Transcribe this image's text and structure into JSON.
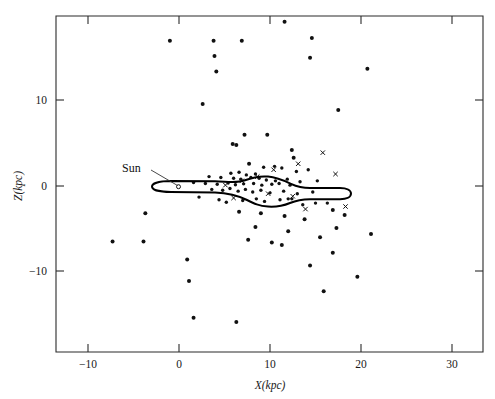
{
  "figure": {
    "background_color": "#ffffff",
    "ink_color": "#111111"
  },
  "chart_data": {
    "type": "scatter",
    "title": "",
    "xlabel": "X(kpc)",
    "ylabel": "Z(kpc)",
    "xlim": [
      -14.5,
      34
    ],
    "ylim": [
      -19.8,
      19.5
    ],
    "xticks": [
      -10,
      0,
      10,
      20,
      30
    ],
    "xticklabels": [
      "−10",
      "0",
      "10",
      "20",
      "30"
    ],
    "yticks": [
      10,
      0,
      -10
    ],
    "yticklabels": [
      "10",
      "0",
      "−10"
    ],
    "grid": false,
    "legend": "none",
    "series": [
      {
        "name": "objects-dot",
        "marker": "dot",
        "color": "#111111",
        "points": [
          [
            11.6,
            19.2
          ],
          [
            -1.0,
            17.0
          ],
          [
            3.8,
            17.0
          ],
          [
            6.9,
            17.0
          ],
          [
            14.6,
            17.3
          ],
          [
            3.9,
            15.2
          ],
          [
            4.1,
            13.4
          ],
          [
            14.4,
            15.0
          ],
          [
            2.6,
            9.6
          ],
          [
            20.7,
            13.7
          ],
          [
            7.2,
            6.0
          ],
          [
            9.7,
            6.0
          ],
          [
            5.9,
            4.9
          ],
          [
            6.3,
            4.8
          ],
          [
            17.5,
            8.9
          ],
          [
            12.4,
            4.2
          ],
          [
            12.6,
            3.3
          ],
          [
            7.7,
            2.6
          ],
          [
            9.3,
            2.2
          ],
          [
            10.5,
            2.3
          ],
          [
            11.3,
            2.1
          ],
          [
            12.9,
            1.7
          ],
          [
            14.2,
            1.9
          ],
          [
            5.7,
            1.5
          ],
          [
            6.6,
            1.6
          ],
          [
            7.4,
            1.3
          ],
          [
            8.4,
            1.4
          ],
          [
            3.3,
            1.1
          ],
          [
            4.6,
            1.0
          ],
          [
            6.0,
            0.9
          ],
          [
            6.8,
            0.8
          ],
          [
            7.9,
            1.0
          ],
          [
            8.8,
            0.9
          ],
          [
            9.6,
            0.7
          ],
          [
            10.6,
            0.6
          ],
          [
            11.9,
            0.8
          ],
          [
            13.3,
            0.5
          ],
          [
            15.2,
            0.6
          ],
          [
            1.6,
            0.4
          ],
          [
            2.9,
            0.3
          ],
          [
            4.2,
            0.2
          ],
          [
            5.4,
            0.35
          ],
          [
            6.2,
            0.15
          ],
          [
            7.1,
            0.25
          ],
          [
            8.2,
            0.3
          ],
          [
            9.1,
            0.1
          ],
          [
            10.2,
            0.2
          ],
          [
            11.0,
            0.3
          ],
          [
            12.2,
            0.1
          ],
          [
            3.6,
            -0.4
          ],
          [
            4.8,
            -0.5
          ],
          [
            5.6,
            -0.3
          ],
          [
            6.5,
            -0.6
          ],
          [
            7.3,
            -0.4
          ],
          [
            8.1,
            -0.7
          ],
          [
            9.0,
            -0.5
          ],
          [
            10.0,
            -0.8
          ],
          [
            11.5,
            -0.6
          ],
          [
            13.0,
            -0.9
          ],
          [
            14.7,
            -0.7
          ],
          [
            2.2,
            -1.3
          ],
          [
            4.4,
            -1.6
          ],
          [
            5.2,
            -1.9
          ],
          [
            7.0,
            -1.7
          ],
          [
            8.5,
            -1.5
          ],
          [
            9.4,
            -1.8
          ],
          [
            11.1,
            -1.6
          ],
          [
            12.0,
            -1.5
          ],
          [
            12.4,
            -1.5
          ],
          [
            13.6,
            -2.2
          ],
          [
            15.0,
            -2.0
          ],
          [
            16.3,
            -2.0
          ],
          [
            16.9,
            -2.8
          ],
          [
            18.2,
            -3.4
          ],
          [
            6.6,
            -3.0
          ],
          [
            9.0,
            -3.2
          ],
          [
            11.6,
            -3.5
          ],
          [
            13.8,
            -3.9
          ],
          [
            -3.7,
            -3.2
          ],
          [
            8.4,
            -4.8
          ],
          [
            17.3,
            -4.9
          ],
          [
            12.0,
            -5.3
          ],
          [
            7.6,
            -6.3
          ],
          [
            10.2,
            -6.6
          ],
          [
            11.3,
            -6.9
          ],
          [
            -7.3,
            -6.5
          ],
          [
            -3.9,
            -6.5
          ],
          [
            15.5,
            -6.0
          ],
          [
            21.1,
            -5.6
          ],
          [
            0.9,
            -8.6
          ],
          [
            16.9,
            -7.8
          ],
          [
            14.4,
            -9.3
          ],
          [
            1.1,
            -11.1
          ],
          [
            19.6,
            -10.6
          ],
          [
            15.9,
            -12.3
          ],
          [
            1.6,
            -15.4
          ],
          [
            6.3,
            -15.9
          ]
        ]
      },
      {
        "name": "objects-cross",
        "marker": "cross",
        "color": "#111111",
        "points": [
          [
            15.8,
            3.9
          ],
          [
            13.1,
            2.6
          ],
          [
            10.4,
            1.9
          ],
          [
            17.2,
            1.4
          ],
          [
            8.6,
            1.1
          ],
          [
            6.9,
            0.6
          ],
          [
            5.1,
            0.1
          ],
          [
            9.8,
            -0.9
          ],
          [
            12.5,
            -1.2
          ],
          [
            6.0,
            -1.4
          ],
          [
            18.3,
            -2.4
          ],
          [
            13.9,
            -2.7
          ]
        ]
      }
    ],
    "annotations": [
      {
        "name": "sun-label",
        "text": "Sun",
        "x": -1.0,
        "y": 2.6,
        "points_to": [
          3.5,
          0.0
        ]
      }
    ],
    "overlay": {
      "name": "galactic-disk-outline",
      "description": "warped Milky Way disk cross-section outline",
      "style": "closed curve, black stroke"
    }
  }
}
